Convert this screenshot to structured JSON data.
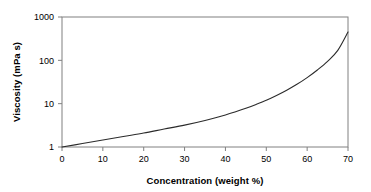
{
  "chart_data": {
    "type": "line",
    "title": "",
    "xlabel": "Concentration (weight %)",
    "ylabel": "Viscosity (mPa s)",
    "xlim": [
      0,
      70
    ],
    "ylim": [
      1,
      1000
    ],
    "yscale": "log",
    "xscale": "linear",
    "grid": false,
    "legend": false,
    "xticks": [
      0,
      10,
      20,
      30,
      40,
      50,
      60,
      70
    ],
    "xtick_labels": [
      "0",
      "10",
      "20",
      "30",
      "40",
      "50",
      "60",
      "70"
    ],
    "yticks": [
      1,
      10,
      100,
      1000
    ],
    "ytick_labels": [
      "1",
      "10",
      "100",
      "1000"
    ],
    "series": [
      {
        "name": "Viscosity vs concentration",
        "color": "#2b2b2b",
        "x": [
          0,
          5,
          10,
          15,
          20,
          25,
          30,
          35,
          40,
          42.5,
          45,
          47.5,
          50,
          52.5,
          55,
          57.5,
          60,
          62.5,
          65,
          67.5,
          70
        ],
        "y": [
          1.0,
          1.2,
          1.45,
          1.75,
          2.1,
          2.6,
          3.2,
          4.1,
          5.5,
          6.5,
          7.8,
          9.6,
          12.0,
          15.5,
          20.5,
          28.0,
          40.0,
          60.0,
          95.0,
          170.0,
          450.0
        ]
      }
    ]
  },
  "axes": {
    "x_title": "Concentration (weight %)",
    "y_title": "Viscosity (mPa s)"
  },
  "style": {
    "axis_color": "#808080",
    "curve_color": "#2b2b2b",
    "text_color": "#000000",
    "background": "#ffffff"
  }
}
